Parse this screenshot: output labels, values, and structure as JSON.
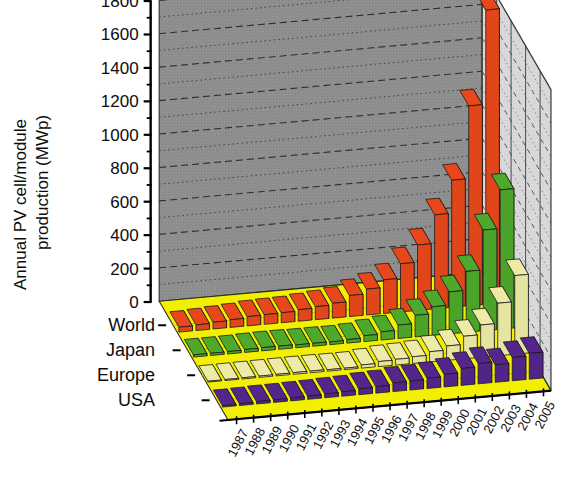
{
  "figure": {
    "background": "#ffffff",
    "back_wall_color": "#8e8e8e",
    "side_wall_color": "#d8d8d8",
    "floor_color": "#f2f000"
  },
  "axis": {
    "y_title_line1": "Annual PV cell/module",
    "y_title_line2": "production (MWp)",
    "y_ticks": [
      "0",
      "200",
      "400",
      "600",
      "800",
      "1000",
      "1200",
      "1400",
      "1600",
      "1800"
    ],
    "y_min": 0,
    "y_max": 1800,
    "y_major_step": 200,
    "y_minor_step": 100
  },
  "series_labels": [
    "World",
    "Japan",
    "Europe",
    "USA"
  ],
  "chart_data": {
    "type": "bar",
    "title": "",
    "subtitle": "",
    "xlabel": "",
    "ylabel": "Annual PV cell/module production (MWp)",
    "ylim": [
      0,
      1800
    ],
    "grid": true,
    "legend_position": "left-row-labels",
    "projection": "3d",
    "categories": [
      "1987",
      "1988",
      "1989",
      "1990",
      "1991",
      "1992",
      "1993",
      "1994",
      "1995",
      "1996",
      "1997",
      "1998",
      "1999",
      "2000",
      "2001",
      "2002",
      "2003",
      "2004",
      "2005"
    ],
    "series": [
      {
        "name": "World",
        "color": "#e8471b",
        "values": [
          29,
          34,
          40,
          46,
          55,
          58,
          60,
          69,
          78,
          89,
          126,
          155,
          201,
          288,
          391,
          562,
          760,
          1195,
          1759
        ]
      },
      {
        "name": "Japan",
        "color": "#4ea82a",
        "values": [
          13,
          13,
          14,
          17,
          19,
          19,
          17,
          17,
          16,
          21,
          35,
          49,
          80,
          129,
          171,
          251,
          364,
          602,
          833
        ]
      },
      {
        "name": "Europe",
        "color": "#edeba6",
        "values": [
          5,
          6,
          7,
          8,
          9,
          10,
          10,
          9,
          9,
          19,
          30,
          34,
          40,
          61,
          86,
          135,
          193,
          314,
          470
        ]
      },
      {
        "name": "USA",
        "color": "#54268c",
        "values": [
          9,
          11,
          14,
          15,
          17,
          19,
          23,
          26,
          35,
          39,
          51,
          54,
          61,
          75,
          101,
          121,
          104,
          139,
          154
        ]
      }
    ]
  }
}
